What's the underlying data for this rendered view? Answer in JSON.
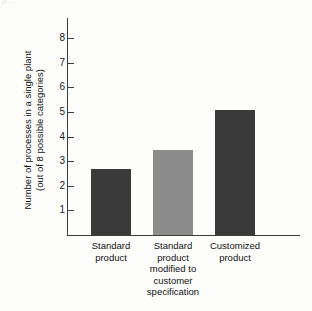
{
  "figure": {
    "top_fragment": "p...",
    "background_color": "#fdfdfc",
    "axis_color": "#3d3d3d"
  },
  "chart_data": {
    "type": "bar",
    "title": "",
    "subtitle": "",
    "xlabel": "",
    "ylabel": "Number of processes in a single plant (out of 8 possible categories)",
    "ylabel_line1": "Number of processes in a single plant",
    "ylabel_line2": "(out of 8 possible categories)",
    "categories": [
      "Standard product",
      "Standard product modified to customer specification",
      "Customized product"
    ],
    "category_label_lines": [
      [
        "Standard",
        "product"
      ],
      [
        "Standard",
        "product",
        "modified to",
        "customer",
        "specification"
      ],
      [
        "Customized",
        "product"
      ]
    ],
    "values": [
      2.7,
      3.45,
      5.1
    ],
    "bar_colors": [
      "#3a3a3a",
      "#8c8c8c",
      "#3a3a3a"
    ],
    "ylim": [
      0,
      8.6
    ],
    "yticks": [
      1,
      2,
      3,
      4,
      5,
      6,
      7,
      8
    ],
    "ytick_labels": [
      "1",
      "2",
      "3",
      "4",
      "5",
      "6",
      "7",
      "8"
    ],
    "grid": false,
    "legend": null,
    "legend_position": "none"
  }
}
